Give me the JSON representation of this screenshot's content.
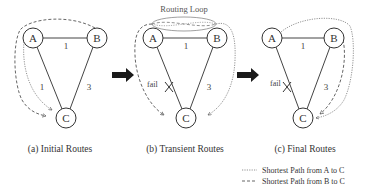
{
  "panels": [
    {
      "id": "a",
      "caption": "(a) Initial Routes",
      "nodes": [
        {
          "label": "A"
        },
        {
          "label": "B"
        },
        {
          "label": "C"
        }
      ],
      "edges": [
        {
          "from": "A",
          "to": "B",
          "weight": "1"
        },
        {
          "from": "A",
          "to": "C",
          "weight": "1"
        },
        {
          "from": "B",
          "to": "C",
          "weight": "3"
        }
      ],
      "routes": {
        "A_to_C": "A -> C",
        "B_to_C": "B -> A -> C"
      }
    },
    {
      "id": "b",
      "caption": "(b) Transient Routes",
      "annotation": "Routing Loop",
      "fail_label": "fail",
      "nodes": [
        {
          "label": "A"
        },
        {
          "label": "B"
        },
        {
          "label": "C"
        }
      ],
      "edges": [
        {
          "from": "A",
          "to": "B",
          "weight": "1"
        },
        {
          "from": "A",
          "to": "C",
          "weight": "",
          "failed": true
        },
        {
          "from": "B",
          "to": "C",
          "weight": "3"
        }
      ],
      "routes": {
        "A_to_C": "A -> B -> A (loop)",
        "B_to_C": "B -> A -> B (loop)"
      }
    },
    {
      "id": "c",
      "caption": "(c) Final Routes",
      "fail_label": "fail",
      "nodes": [
        {
          "label": "A"
        },
        {
          "label": "B"
        },
        {
          "label": "C"
        }
      ],
      "edges": [
        {
          "from": "A",
          "to": "B",
          "weight": "1"
        },
        {
          "from": "A",
          "to": "C",
          "weight": "",
          "failed": true
        },
        {
          "from": "B",
          "to": "C",
          "weight": "3"
        }
      ],
      "routes": {
        "A_to_C": "A -> B -> C",
        "B_to_C": "B -> C"
      }
    }
  ],
  "legend": [
    {
      "style": "dotted",
      "label": "Shortest Path from A to C"
    },
    {
      "style": "dashed",
      "label": "Shortest Path from B to C"
    }
  ],
  "colors": {
    "line": "#444444",
    "arrow": "#222222",
    "background": "#ffffff"
  }
}
